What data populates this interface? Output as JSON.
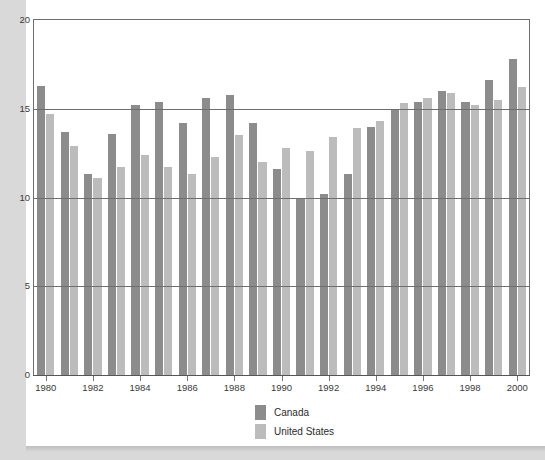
{
  "chart_data": {
    "type": "bar",
    "title": "",
    "xlabel": "",
    "ylabel": "",
    "ylim": [
      0,
      20
    ],
    "yticks": [
      0,
      5,
      10,
      15,
      20
    ],
    "grid": true,
    "legend_position": "bottom-center",
    "categories": [
      "1980",
      "1981",
      "1982",
      "1983",
      "1984",
      "1985",
      "1986",
      "1987",
      "1988",
      "1989",
      "1990",
      "1991",
      "1992",
      "1993",
      "1994",
      "1995",
      "1996",
      "1997",
      "1998",
      "1999",
      "2000"
    ],
    "xtick_labels": [
      "1980",
      "1982",
      "1984",
      "1986",
      "1988",
      "1990",
      "1992",
      "1994",
      "1996",
      "1998",
      "2000"
    ],
    "series": [
      {
        "name": "Canada",
        "color": "#8c8c8c",
        "values": [
          16.3,
          13.7,
          11.3,
          13.6,
          15.2,
          15.4,
          14.2,
          15.6,
          15.8,
          14.2,
          11.6,
          10.0,
          10.2,
          11.3,
          14.0,
          15.0,
          15.4,
          16.0,
          15.4,
          16.6,
          17.8
        ]
      },
      {
        "name": "United States",
        "color": "#bcbcbc",
        "values": [
          14.7,
          12.9,
          11.1,
          11.7,
          12.4,
          11.7,
          11.3,
          12.3,
          13.5,
          12.0,
          12.8,
          12.6,
          13.4,
          13.9,
          14.3,
          15.3,
          15.6,
          15.9,
          15.2,
          15.5,
          16.2
        ]
      }
    ]
  },
  "legend": {
    "items": [
      {
        "label": "Canada",
        "color": "#8c8c8c"
      },
      {
        "label": "United States",
        "color": "#bcbcbc"
      }
    ]
  },
  "colors": {
    "background": "#d9d9d9",
    "card": "#ffffff",
    "frame": "#6e6e6e",
    "canada": "#8c8c8c",
    "united_states": "#bcbcbc",
    "text": "#3a3a3a"
  }
}
